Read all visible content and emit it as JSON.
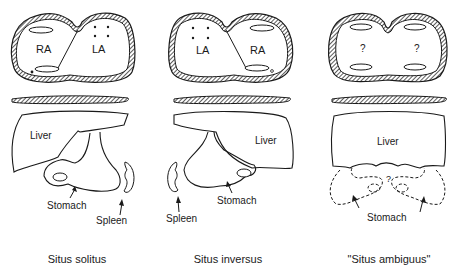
{
  "panels": [
    {
      "caption": "Situs solitus",
      "atria": {
        "left_label": "RA",
        "right_label": "LA"
      },
      "organs": {
        "liver": "Liver",
        "stomach": "Stomach",
        "spleen": "Spleen"
      }
    },
    {
      "caption": "Situs inversus",
      "atria": {
        "left_label": "LA",
        "right_label": "RA"
      },
      "organs": {
        "liver": "Liver",
        "stomach": "Stomach",
        "spleen": "Spleen"
      }
    },
    {
      "caption": "\"Situs ambiguus\"",
      "atria": {
        "left_label": "?",
        "right_label": "?"
      },
      "organs": {
        "liver": "Liver",
        "stomach": "Stomach",
        "unknown": "?"
      }
    }
  ],
  "colors": {
    "line": "#1a1a1a",
    "hatch": "#555555",
    "background": "#ffffff"
  }
}
